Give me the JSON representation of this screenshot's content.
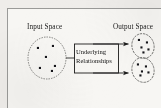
{
  "figure": {
    "type": "diagram",
    "style": "scanned-document-figure",
    "background_color": "#f7f6f3",
    "frame_color": "#9a9a98",
    "ink_color": "#1b1b1b"
  },
  "labels": {
    "input_space": "Input Space",
    "output_space": "Output Space"
  },
  "process_box": {
    "line1": "Underlying",
    "line2": "Relationships"
  },
  "input_region": {
    "outline": "dotted-ellipse",
    "center": [
      47,
      58
    ],
    "rx": 19,
    "ry": 21,
    "point_count": 6,
    "points": [
      [
        38,
        48
      ],
      [
        53,
        46
      ],
      [
        46,
        57
      ],
      [
        40,
        68
      ],
      [
        55,
        66
      ],
      [
        52,
        71
      ]
    ]
  },
  "output_regions": [
    {
      "name": "cluster-upper",
      "outline": "dashed-ellipse",
      "center": [
        143,
        46
      ],
      "rx": 11,
      "ry": 12,
      "point_count": 5,
      "points": [
        [
          139,
          40
        ],
        [
          147,
          42
        ],
        [
          141,
          47
        ],
        [
          148,
          49
        ],
        [
          143,
          52
        ]
      ]
    },
    {
      "name": "cluster-lower",
      "outline": "dashed-ellipse",
      "center": [
        143,
        70
      ],
      "rx": 11,
      "ry": 12,
      "point_count": 5,
      "points": [
        [
          138,
          64
        ],
        [
          146,
          66
        ],
        [
          142,
          71
        ],
        [
          148,
          72
        ],
        [
          140,
          75
        ]
      ]
    }
  ],
  "arrows": [
    {
      "name": "arrow-to-upper-cluster",
      "from": [
        93,
        44
      ],
      "to": [
        129,
        44
      ]
    },
    {
      "name": "arrow-to-lower-cluster",
      "from": [
        93,
        73
      ],
      "to": [
        129,
        73
      ]
    }
  ],
  "connector": {
    "name": "input-to-box-connector",
    "from": [
      66,
      58
    ],
    "to": [
      74,
      58
    ]
  }
}
